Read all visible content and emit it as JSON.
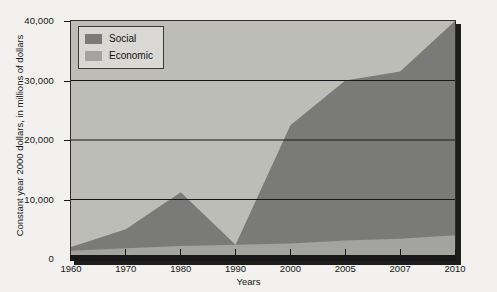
{
  "chart_data": {
    "type": "area",
    "stacked": true,
    "title": "",
    "xlabel": "Years",
    "ylabel": "Constant year 2000 dollars, in millions of dollars",
    "categories": [
      "1960",
      "1970",
      "1980",
      "1990",
      "2000",
      "2005",
      "2007",
      "2010"
    ],
    "ylim": [
      0,
      40000
    ],
    "yticks": [
      0,
      10000,
      20000,
      30000,
      40000
    ],
    "ytick_labels": [
      "0",
      "10,000",
      "20,000",
      "30,000",
      "40,000"
    ],
    "grid": "horizontal",
    "legend_position": "top-left",
    "series": [
      {
        "name": "Social",
        "color": "#7a7a78",
        "values": [
          600,
          3200,
          9000,
          0,
          19900,
          26900,
          28100,
          36000
        ]
      },
      {
        "name": "Economic",
        "color": "#a3a3a0",
        "values": [
          1400,
          1800,
          2200,
          2400,
          2600,
          3100,
          3400,
          4000
        ]
      }
    ],
    "totals": [
      2000,
      5000,
      11200,
      2400,
      22500,
      30000,
      31500,
      40000
    ],
    "plot_background": "#bdbdb8",
    "axis_color": "#17171a",
    "page_background": "#f2f1ef"
  },
  "legend": {
    "items": [
      {
        "label": "Social",
        "color": "#7a7a78"
      },
      {
        "label": "Economic",
        "color": "#a3a3a0"
      }
    ]
  },
  "axes": {
    "x_title": "Years",
    "y_title": "Constant year 2000 dollars, in millions of dollars"
  }
}
